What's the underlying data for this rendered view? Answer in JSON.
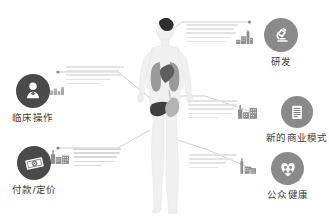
{
  "page": {
    "title": "医疗健康行业价值链信息图",
    "background_color": "#ffffff",
    "text_color": "#3b3b3b",
    "accent_gray": "#6e6e6e",
    "line_color": "#bdbdbd"
  },
  "center": {
    "name": "human-body-diagram",
    "organs": [
      {
        "name": "brain",
        "label": "脑",
        "color": "#2f2f2f"
      },
      {
        "name": "lungs",
        "label": "肺",
        "color": "#9a9a9a"
      },
      {
        "name": "heart",
        "label": "心脏",
        "color": "#5d5d5d"
      },
      {
        "name": "liver",
        "label": "肝",
        "color": "#3f3f3f"
      },
      {
        "name": "stomach",
        "label": "胃",
        "color": "#b4b4b4"
      }
    ]
  },
  "nodes": [
    {
      "id": "clinical-operations",
      "label": "临床操作",
      "icon": "doctor-icon",
      "side": "left",
      "badge_tone": "dark",
      "skyline": "factory-small",
      "text_lines": 5
    },
    {
      "id": "payment-pricing",
      "label": "付款/定价",
      "icon": "money-icon",
      "side": "left",
      "badge_tone": "dark",
      "skyline": "factory-wide",
      "text_lines": 5
    },
    {
      "id": "research-development",
      "label": "研发",
      "icon": "microscope-icon",
      "side": "right",
      "badge_tone": "mid",
      "skyline": "chart-bars",
      "text_lines": 5
    },
    {
      "id": "new-business-model",
      "label": "新的商业模式",
      "icon": "building-icon",
      "side": "right",
      "badge_tone": "mid",
      "skyline": "factory-wide",
      "text_lines": 5
    },
    {
      "id": "public-health",
      "label": "公众健康",
      "icon": "heart-people-icon",
      "side": "right",
      "badge_tone": "mid",
      "skyline": "factory-tall",
      "text_lines": 4
    }
  ]
}
